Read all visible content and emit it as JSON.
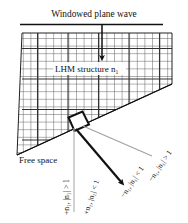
{
  "figure": {
    "title": "Windowed plane wave",
    "regions": {
      "upper_label": "LHM structure n",
      "upper_label_sub": "1",
      "lower_label": "Free space"
    },
    "ray_labels": {
      "positive_high": "+n₁, |n₁| > 1",
      "positive_low": "+n₁, |n₁| < 1",
      "negative_low": "−n₁, |n₁| < 1",
      "negative_high": "−n₁, |n₁| > 1"
    },
    "colors": {
      "ink": "#111111",
      "grid": "#4a4a4a",
      "guide": "#a9a9a9",
      "background": "#ffffff"
    }
  }
}
